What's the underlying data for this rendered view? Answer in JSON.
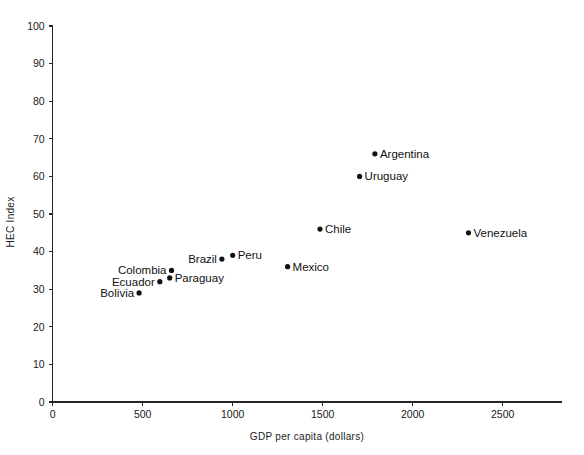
{
  "chart_data": {
    "type": "scatter",
    "title": "",
    "xlabel": "GDP per capita (dollars)",
    "ylabel": "HEC Index",
    "xlim": [
      0,
      2800
    ],
    "ylim": [
      0,
      100
    ],
    "grid": false,
    "legend": "none",
    "xticks": [
      0,
      500,
      1000,
      1500,
      2000,
      2500
    ],
    "xtick_labels": [
      "0",
      "500",
      "1000",
      "1500",
      "2000",
      "2500"
    ],
    "yticks": [
      0,
      10,
      20,
      30,
      40,
      50,
      60,
      70,
      80,
      90,
      100
    ],
    "ytick_labels": [
      "0",
      "10",
      "20",
      "30",
      "40",
      "50",
      "60",
      "70",
      "80",
      "90",
      "100"
    ],
    "point_color": "#111111",
    "axis_color": "#262626",
    "points": [
      {
        "label": "Bolivia",
        "x": 480,
        "y": 29,
        "label_side": "left"
      },
      {
        "label": "Ecuador",
        "x": 595,
        "y": 32,
        "label_side": "left"
      },
      {
        "label": "Paraguay",
        "x": 650,
        "y": 33,
        "label_side": "right"
      },
      {
        "label": "Colombia",
        "x": 660,
        "y": 35,
        "label_side": "left"
      },
      {
        "label": "Brazil",
        "x": 940,
        "y": 38,
        "label_side": "left"
      },
      {
        "label": "Peru",
        "x": 1000,
        "y": 39,
        "label_side": "right"
      },
      {
        "label": "Mexico",
        "x": 1305,
        "y": 36,
        "label_side": "right"
      },
      {
        "label": "Chile",
        "x": 1485,
        "y": 46,
        "label_side": "right"
      },
      {
        "label": "Uruguay",
        "x": 1705,
        "y": 60,
        "label_side": "right"
      },
      {
        "label": "Argentina",
        "x": 1790,
        "y": 66,
        "label_side": "right"
      },
      {
        "label": "Venezuela",
        "x": 2310,
        "y": 45,
        "label_side": "right"
      }
    ]
  }
}
